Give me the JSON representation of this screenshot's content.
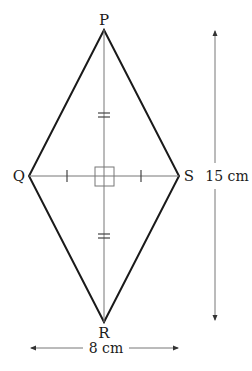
{
  "diagram": {
    "shape": "rhombus",
    "vertices": {
      "P": {
        "label": "P"
      },
      "Q": {
        "label": "Q"
      },
      "R": {
        "label": "R"
      },
      "S": {
        "label": "S"
      }
    },
    "dimensions": {
      "vertical": "15 cm",
      "horizontal": "8 cm"
    },
    "markings": {
      "right_angle_at_center": true,
      "single_ticks_on": "QS halves",
      "double_ticks_on": "PR halves"
    },
    "colors": {
      "outline": "#1a1a1a",
      "diagonal": "#6e6e6e",
      "background": "#ffffff"
    }
  }
}
